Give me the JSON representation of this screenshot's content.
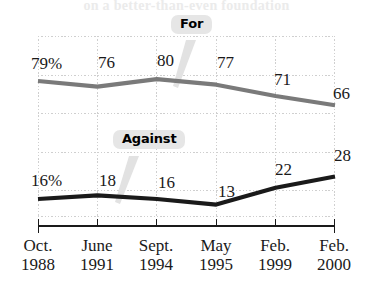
{
  "title_remnant": "on a better-than-even foundation",
  "chart_data": {
    "type": "line",
    "title": "",
    "xlabel": "",
    "ylabel": "",
    "grid": true,
    "legend_position": "inline-callout",
    "categories": [
      "Oct. 1988",
      "June 1991",
      "Sept. 1994",
      "May 1995",
      "Feb. 1999",
      "Feb. 2000"
    ],
    "category_months": [
      "Oct.",
      "June",
      "Sept.",
      "May",
      "Feb.",
      "Feb."
    ],
    "category_years": [
      "1988",
      "1991",
      "1994",
      "1995",
      "1999",
      "2000"
    ],
    "ylim": [
      0,
      100
    ],
    "series": [
      {
        "name": "For",
        "color": "#7a7a7a",
        "values": [
          79,
          76,
          80,
          77,
          71,
          66
        ],
        "point_labels": [
          "79%",
          "76",
          "80",
          "77",
          "71",
          "66"
        ]
      },
      {
        "name": "Against",
        "color": "#1a1a1a",
        "values": [
          16,
          18,
          16,
          13,
          22,
          28
        ],
        "point_labels": [
          "16%",
          "18",
          "16",
          "13",
          "22",
          "28"
        ]
      }
    ]
  },
  "callouts": {
    "for_label": "For",
    "against_label": "Against"
  },
  "colors": {
    "for_line": "#7a7a7a",
    "against_line": "#1a1a1a",
    "gridline": "#cfcfcf",
    "axis": "#1a1a1a",
    "callout_background": "#e6e6e6"
  }
}
